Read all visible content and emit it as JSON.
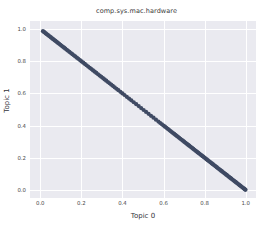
{
  "figure": {
    "width": 273,
    "height": 234,
    "background": "#ffffff",
    "plot_background": "#eaeaf0",
    "grid_color": "#ffffff",
    "point_color": "#3f4a63"
  },
  "chart_data": {
    "type": "scatter",
    "title": "comp.sys.mac.hardware",
    "xlabel": "Topic 0",
    "ylabel": "Topic 1",
    "xlim": [
      -0.05,
      1.05
    ],
    "ylim": [
      -0.05,
      1.05
    ],
    "grid": true,
    "legend": null,
    "xticks": [
      "0.0",
      "0.2",
      "0.4",
      "0.6",
      "0.8",
      "1.0"
    ],
    "xtick_values": [
      0.0,
      0.2,
      0.4,
      0.6,
      0.8,
      1.0
    ],
    "yticks": [
      "0.0",
      "0.2",
      "0.4",
      "0.6",
      "0.8",
      "1.0"
    ],
    "ytick_values": [
      0.0,
      0.2,
      0.4,
      0.6,
      0.8,
      1.0
    ],
    "relation": "y = 1 - x",
    "marker_size": 2.1,
    "series": [
      {
        "name": "documents",
        "color": "#3f4a63",
        "x": [
          0.013,
          0.018,
          0.022,
          0.027,
          0.031,
          0.036,
          0.041,
          0.047,
          0.052,
          0.058,
          0.063,
          0.069,
          0.074,
          0.08,
          0.086,
          0.092,
          0.098,
          0.104,
          0.11,
          0.116,
          0.122,
          0.129,
          0.135,
          0.142,
          0.149,
          0.156,
          0.163,
          0.17,
          0.178,
          0.185,
          0.193,
          0.201,
          0.209,
          0.217,
          0.225,
          0.233,
          0.241,
          0.249,
          0.257,
          0.265,
          0.273,
          0.281,
          0.289,
          0.297,
          0.305,
          0.313,
          0.321,
          0.329,
          0.337,
          0.345,
          0.353,
          0.362,
          0.371,
          0.38,
          0.39,
          0.4,
          0.41,
          0.421,
          0.432,
          0.443,
          0.455,
          0.467,
          0.479,
          0.491,
          0.503,
          0.515,
          0.527,
          0.539,
          0.551,
          0.563,
          0.575,
          0.584,
          0.592,
          0.6,
          0.607,
          0.614,
          0.621,
          0.628,
          0.634,
          0.64,
          0.646,
          0.652,
          0.658,
          0.664,
          0.67,
          0.676,
          0.682,
          0.688,
          0.694,
          0.7,
          0.705,
          0.71,
          0.715,
          0.72,
          0.725,
          0.73,
          0.735,
          0.74,
          0.745,
          0.75,
          0.755,
          0.76,
          0.765,
          0.77,
          0.775,
          0.78,
          0.785,
          0.79,
          0.795,
          0.8,
          0.805,
          0.81,
          0.815,
          0.82,
          0.825,
          0.83,
          0.835,
          0.84,
          0.845,
          0.85,
          0.855,
          0.86,
          0.865,
          0.87,
          0.875,
          0.88,
          0.885,
          0.89,
          0.895,
          0.9,
          0.905,
          0.91,
          0.915,
          0.92,
          0.925,
          0.93,
          0.935,
          0.94,
          0.945,
          0.95,
          0.955,
          0.96,
          0.965,
          0.97,
          0.975,
          0.98,
          0.985,
          0.99,
          0.993,
          0.996,
          0.999
        ],
        "y": [
          0.987,
          0.982,
          0.978,
          0.973,
          0.969,
          0.964,
          0.959,
          0.953,
          0.948,
          0.942,
          0.937,
          0.931,
          0.926,
          0.92,
          0.914,
          0.908,
          0.902,
          0.896,
          0.89,
          0.884,
          0.878,
          0.871,
          0.865,
          0.858,
          0.851,
          0.844,
          0.837,
          0.83,
          0.822,
          0.815,
          0.807,
          0.799,
          0.791,
          0.783,
          0.775,
          0.767,
          0.759,
          0.751,
          0.743,
          0.735,
          0.727,
          0.719,
          0.711,
          0.703,
          0.695,
          0.687,
          0.679,
          0.671,
          0.663,
          0.655,
          0.647,
          0.638,
          0.629,
          0.62,
          0.61,
          0.6,
          0.59,
          0.579,
          0.568,
          0.557,
          0.545,
          0.533,
          0.521,
          0.509,
          0.497,
          0.485,
          0.473,
          0.461,
          0.449,
          0.437,
          0.425,
          0.416,
          0.408,
          0.4,
          0.393,
          0.386,
          0.379,
          0.372,
          0.366,
          0.36,
          0.354,
          0.348,
          0.342,
          0.336,
          0.33,
          0.324,
          0.318,
          0.312,
          0.306,
          0.3,
          0.295,
          0.29,
          0.285,
          0.28,
          0.275,
          0.27,
          0.265,
          0.26,
          0.255,
          0.25,
          0.245,
          0.24,
          0.235,
          0.23,
          0.225,
          0.22,
          0.215,
          0.21,
          0.205,
          0.2,
          0.195,
          0.19,
          0.185,
          0.18,
          0.175,
          0.17,
          0.165,
          0.16,
          0.155,
          0.15,
          0.145,
          0.14,
          0.135,
          0.13,
          0.125,
          0.12,
          0.115,
          0.11,
          0.105,
          0.1,
          0.095,
          0.09,
          0.085,
          0.08,
          0.075,
          0.07,
          0.065,
          0.06,
          0.055,
          0.05,
          0.045,
          0.04,
          0.035,
          0.03,
          0.025,
          0.02,
          0.015,
          0.01,
          0.007,
          0.004,
          0.001
        ]
      }
    ]
  }
}
